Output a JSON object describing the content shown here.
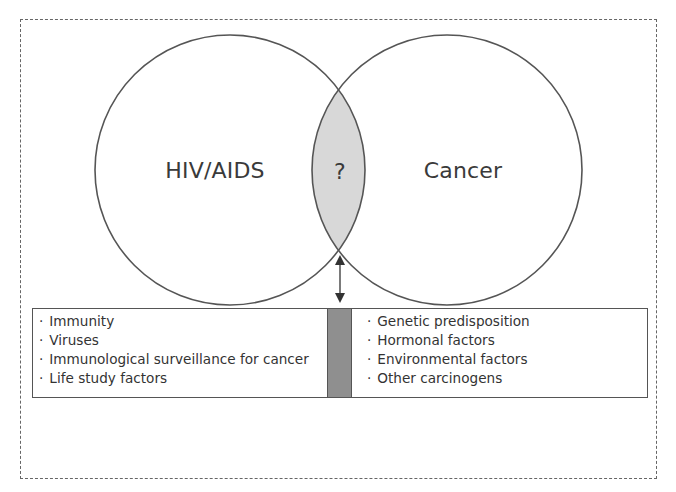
{
  "diagram": {
    "type": "venn",
    "circles": [
      {
        "label": "HIV/AIDS"
      },
      {
        "label": "Cancer"
      }
    ],
    "intersection_label": "?",
    "colors": {
      "intersection_fill": "#d8d8d8",
      "bar_fill": "#8f8f8f",
      "stroke": "#555555",
      "frame_stroke": "#666666"
    },
    "left_factors": [
      "Immunity",
      "Viruses",
      "Immunological surveillance for cancer",
      "Life study factors"
    ],
    "right_factors": [
      "Genetic predisposition",
      "Hormonal factors",
      "Environmental factors",
      "Other carcinogens"
    ],
    "arrow": "bidirectional-vertical"
  }
}
